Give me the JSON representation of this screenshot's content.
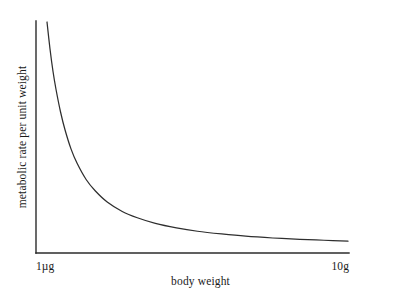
{
  "chart_data": {
    "type": "line",
    "title": "",
    "subtitle": "",
    "xlabel": "body weight",
    "ylabel": "metabolic rate per unit weight",
    "grid": false,
    "legend": null,
    "legend_position": "none",
    "annotations": [],
    "x_tick_labels": [
      "1µg",
      "10g"
    ],
    "y_tick_labels": [],
    "xlim": [
      0,
      1
    ],
    "ylim": [
      0,
      1
    ],
    "axis_color": "#2b2b2b",
    "curve_color": "#2e2e2e",
    "background_color": "#ffffff",
    "series": [
      {
        "name": "metabolic rate per unit weight",
        "description": "hyperbolic decay: rate per unit mass falls steeply with increasing body weight, approaching an asymptote",
        "x": [
          0.0,
          0.01,
          0.02,
          0.03,
          0.045,
          0.06,
          0.08,
          0.1,
          0.13,
          0.16,
          0.2,
          0.25,
          0.3,
          0.36,
          0.43,
          0.5,
          0.58,
          0.66,
          0.75,
          0.84,
          0.92,
          1.0
        ],
        "y": [
          1.0,
          0.88,
          0.78,
          0.7,
          0.6,
          0.52,
          0.435,
          0.372,
          0.3,
          0.25,
          0.2,
          0.158,
          0.13,
          0.105,
          0.085,
          0.07,
          0.058,
          0.048,
          0.04,
          0.034,
          0.03,
          0.026
        ]
      }
    ]
  },
  "chart_geometry": {
    "y_axis_x": 36,
    "y_axis_top": 21,
    "x_axis_y": 253,
    "x_axis_right": 349,
    "curve_start_x": 47,
    "curve_start_y": 22,
    "curve_end_x": 348,
    "curve_end_y": 247
  }
}
